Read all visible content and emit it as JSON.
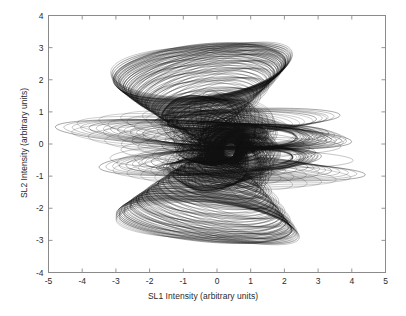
{
  "chart_data": {
    "type": "line",
    "title": "",
    "xlabel": "SL1 Intensity (arbitrary units)",
    "ylabel": "SL2 Intensity (arbitrary units)",
    "xlim": [
      -5,
      5
    ],
    "ylim": [
      -4,
      4
    ],
    "xticks": [
      -5,
      -4,
      -3,
      -2,
      -1,
      0,
      1,
      2,
      3,
      4,
      5
    ],
    "xticklabels": [
      "-5",
      "-4",
      "-3",
      "-2",
      "-1",
      "0",
      "1",
      "2",
      "3",
      "4",
      "5"
    ],
    "yticks": [
      -4,
      -3,
      -2,
      -1,
      0,
      1,
      2,
      3,
      4
    ],
    "yticklabels": [
      "-4",
      "-3",
      "-2",
      "-1",
      "0",
      "1",
      "2",
      "3",
      "4"
    ],
    "grid": false,
    "legend": null,
    "line_color": "#111111",
    "line_width": 0.45,
    "background": "#ffffff",
    "frame_color": "#8a8a8a",
    "series": [
      {
        "name": "trajectory",
        "kind": "ellipse-family",
        "note": "Upper wing lobe: elongated ellipses tilted ~75 deg, growing from the core toward (-0.55, 3.95).",
        "ellipses": [
          {
            "cx": -0.3,
            "cy": 0.45,
            "rx": 0.28,
            "ry": 0.5,
            "rot": -76
          },
          {
            "cx": -0.32,
            "cy": 0.7,
            "rx": 0.36,
            "ry": 0.8,
            "rot": -77
          },
          {
            "cx": -0.34,
            "cy": 0.95,
            "rx": 0.44,
            "ry": 1.1,
            "rot": -78
          },
          {
            "cx": -0.36,
            "cy": 1.2,
            "rx": 0.52,
            "ry": 1.4,
            "rot": -79
          },
          {
            "cx": -0.38,
            "cy": 1.45,
            "rx": 0.58,
            "ry": 1.68,
            "rot": -80
          },
          {
            "cx": -0.4,
            "cy": 1.66,
            "rx": 0.64,
            "ry": 1.92,
            "rot": -80
          },
          {
            "cx": -0.42,
            "cy": 1.84,
            "rx": 0.69,
            "ry": 2.12,
            "rot": -81
          },
          {
            "cx": -0.44,
            "cy": 1.99,
            "rx": 0.73,
            "ry": 2.28,
            "rot": -81
          },
          {
            "cx": -0.46,
            "cy": 2.1,
            "rx": 0.76,
            "ry": 2.4,
            "rot": -82
          },
          {
            "cx": -0.48,
            "cy": 2.18,
            "rx": 0.79,
            "ry": 2.49,
            "rot": -82
          },
          {
            "cx": -0.5,
            "cy": 2.24,
            "rx": 0.81,
            "ry": 2.55,
            "rot": -83
          },
          {
            "cx": -0.52,
            "cy": 2.28,
            "rx": 0.82,
            "ry": 2.58,
            "rot": -83
          }
        ]
      },
      {
        "name": "trajectory-lower",
        "kind": "ellipse-family",
        "note": "Lower lobe: tilted ellipses descending to (-0.60, -3.90).",
        "ellipses": [
          {
            "cx": 0.05,
            "cy": -0.45,
            "rx": 0.26,
            "ry": 0.5,
            "rot": 78
          },
          {
            "cx": 0.02,
            "cy": -0.7,
            "rx": 0.33,
            "ry": 0.78,
            "rot": 79
          },
          {
            "cx": -0.02,
            "cy": -0.96,
            "rx": 0.4,
            "ry": 1.08,
            "rot": 80
          },
          {
            "cx": -0.06,
            "cy": -1.22,
            "rx": 0.46,
            "ry": 1.38,
            "rot": 80
          },
          {
            "cx": -0.1,
            "cy": -1.48,
            "rx": 0.51,
            "ry": 1.66,
            "rot": 81
          },
          {
            "cx": -0.15,
            "cy": -1.72,
            "rx": 0.55,
            "ry": 1.92,
            "rot": 81
          },
          {
            "cx": -0.2,
            "cy": -1.94,
            "rx": 0.58,
            "ry": 2.14,
            "rot": 82
          },
          {
            "cx": -0.25,
            "cy": -2.12,
            "rx": 0.6,
            "ry": 2.32,
            "rot": 82
          },
          {
            "cx": -0.3,
            "cy": -2.26,
            "rx": 0.61,
            "ry": 2.46,
            "rot": 83
          },
          {
            "cx": -0.34,
            "cy": -2.36,
            "rx": 0.62,
            "ry": 2.56,
            "rot": 83
          },
          {
            "cx": -0.38,
            "cy": -2.42,
            "rx": 0.62,
            "ry": 2.62,
            "rot": 84
          }
        ]
      },
      {
        "name": "trajectory-left-fan",
        "kind": "ellipse-family",
        "note": "Flat wide ellipses extending left to SL1 = -4.8 near SL2 = 0.3 and -0.5.",
        "ellipses": [
          {
            "cx": -0.4,
            "cy": 0.3,
            "rx": 4.4,
            "ry": 0.4,
            "rot": -3
          },
          {
            "cx": -0.2,
            "cy": 0.32,
            "rx": 3.6,
            "ry": 0.38,
            "rot": -3
          },
          {
            "cx": -0.05,
            "cy": 0.3,
            "rx": 2.9,
            "ry": 0.36,
            "rot": -3
          },
          {
            "cx": 0.1,
            "cy": 0.25,
            "rx": 2.3,
            "ry": 0.34,
            "rot": -2
          },
          {
            "cx": -0.2,
            "cy": -0.55,
            "rx": 3.3,
            "ry": 0.4,
            "rot": 3
          },
          {
            "cx": 0.0,
            "cy": -0.52,
            "rx": 2.7,
            "ry": 0.38,
            "rot": 3
          },
          {
            "cx": 0.15,
            "cy": -0.48,
            "rx": 2.1,
            "ry": 0.34,
            "rot": 2
          }
        ]
      },
      {
        "name": "trajectory-right-fan",
        "kind": "ellipse-family",
        "note": "Flat wide ellipses extending right to SL1 = 3.6 (upper, SL2 ~ 0.85) and 4.4 (lower, SL2 ~ -0.9).",
        "ellipses": [
          {
            "cx": 0.9,
            "cy": 0.8,
            "rx": 2.75,
            "ry": 0.3,
            "rot": 2
          },
          {
            "cx": 0.75,
            "cy": 0.7,
            "rx": 2.2,
            "ry": 0.3,
            "rot": 2
          },
          {
            "cx": 1.3,
            "cy": -0.85,
            "rx": 3.1,
            "ry": 0.28,
            "rot": -2
          },
          {
            "cx": 1.0,
            "cy": -0.75,
            "rx": 2.4,
            "ry": 0.28,
            "rot": -2
          },
          {
            "cx": 0.8,
            "cy": -0.65,
            "rx": 1.9,
            "ry": 0.26,
            "rot": -2
          }
        ]
      },
      {
        "name": "trajectory-core",
        "kind": "ellipse-family",
        "note": "Dense overlapping core ellipses around the origin producing the solid black region.",
        "ellipses": [
          {
            "cx": 0.15,
            "cy": 0.05,
            "rx": 1.4,
            "ry": 0.55,
            "rot": 10
          },
          {
            "cx": 0.2,
            "cy": 0.0,
            "rx": 1.2,
            "ry": 0.48,
            "rot": 18
          },
          {
            "cx": 0.25,
            "cy": -0.05,
            "rx": 1.0,
            "ry": 0.42,
            "rot": 26
          },
          {
            "cx": 0.3,
            "cy": -0.1,
            "rx": 0.85,
            "ry": 0.36,
            "rot": 34
          },
          {
            "cx": 0.32,
            "cy": -0.12,
            "rx": 0.7,
            "ry": 0.3,
            "rot": 44
          },
          {
            "cx": 0.34,
            "cy": -0.14,
            "rx": 0.58,
            "ry": 0.26,
            "rot": 54
          },
          {
            "cx": 0.36,
            "cy": -0.15,
            "rx": 0.46,
            "ry": 0.22,
            "rot": 64
          },
          {
            "cx": 0.38,
            "cy": -0.16,
            "rx": 0.36,
            "ry": 0.18,
            "rot": 74
          }
        ]
      }
    ],
    "extrema": {
      "x_min": -4.8,
      "x_max": 4.4,
      "y_min": -3.9,
      "y_max": 3.95
    }
  }
}
